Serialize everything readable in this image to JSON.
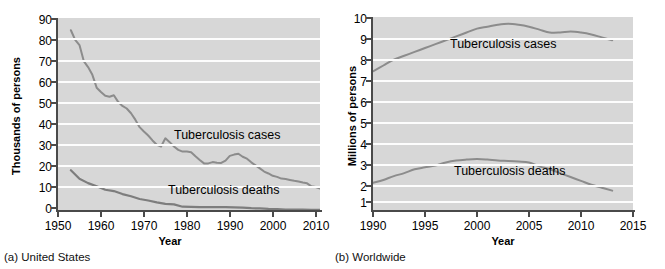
{
  "chart_data": [
    {
      "type": "line",
      "panel": "a",
      "caption": "(a) United States",
      "title": "",
      "xlabel": "Year",
      "ylabel": "Thousands of persons",
      "xlim": [
        1950,
        2011
      ],
      "ylim": [
        0,
        90
      ],
      "xticks": [
        1950,
        1960,
        1970,
        1980,
        1990,
        2000,
        2010
      ],
      "yticks": [
        0,
        10,
        20,
        30,
        40,
        50,
        60,
        70,
        80,
        90
      ],
      "grid": "horizontal",
      "legend_position": "inline-annotation",
      "series": [
        {
          "name": "Tuberculosis cases",
          "x": [
            1953,
            1954,
            1955,
            1956,
            1957,
            1958,
            1959,
            1960,
            1961,
            1962,
            1963,
            1964,
            1965,
            1966,
            1967,
            1968,
            1969,
            1970,
            1971,
            1972,
            1973,
            1974,
            1975,
            1976,
            1977,
            1978,
            1979,
            1980,
            1981,
            1982,
            1983,
            1984,
            1985,
            1986,
            1987,
            1988,
            1989,
            1990,
            1991,
            1992,
            1993,
            1994,
            1995,
            1996,
            1997,
            1998,
            1999,
            2000,
            2001,
            2002,
            2003,
            2004,
            2005,
            2006,
            2007,
            2008,
            2009,
            2010,
            2011
          ],
          "values": [
            84.3,
            79.8,
            77.4,
            69.9,
            67.1,
            63.5,
            57.5,
            55.5,
            53.7,
            53.3,
            54.0,
            50.9,
            49.0,
            47.8,
            45.6,
            42.6,
            39.1,
            37.1,
            35.2,
            32.9,
            30.9,
            30.1,
            33.9,
            32.1,
            30.1,
            28.5,
            27.7,
            27.7,
            27.4,
            25.5,
            23.8,
            22.2,
            22.2,
            22.8,
            22.5,
            22.4,
            23.5,
            25.7,
            26.3,
            26.7,
            25.3,
            24.4,
            22.7,
            21.3,
            19.9,
            18.4,
            17.5,
            16.4,
            15.9,
            15.1,
            14.9,
            14.5,
            14.1,
            13.8,
            13.3,
            12.9,
            11.5,
            11.2,
            10.5
          ]
        },
        {
          "name": "Tuberculosis deaths",
          "x": [
            1953,
            1955,
            1957,
            1959,
            1961,
            1963,
            1965,
            1967,
            1969,
            1971,
            1973,
            1975,
            1977,
            1979,
            1981,
            1983,
            1985,
            1987,
            1989,
            1991,
            1993,
            1995,
            1997,
            1999,
            2001,
            2003,
            2005,
            2007,
            2009,
            2011
          ],
          "values": [
            19.0,
            15.0,
            13.0,
            11.5,
            9.9,
            9.3,
            7.9,
            6.9,
            5.6,
            4.9,
            4.0,
            3.3,
            3.1,
            2.0,
            1.9,
            1.8,
            1.8,
            1.8,
            1.8,
            1.7,
            1.6,
            1.3,
            1.2,
            1.0,
            0.9,
            0.7,
            0.6,
            0.6,
            0.5,
            0.5
          ]
        }
      ]
    },
    {
      "type": "line",
      "panel": "b",
      "caption": "(b) Worldwide",
      "title": "",
      "xlabel": "Year",
      "ylabel": "Millions of persons",
      "xlim": [
        1990,
        2015
      ],
      "ylim": [
        0,
        10
      ],
      "xticks": [
        1990,
        1995,
        2000,
        2005,
        2010,
        2015
      ],
      "yticks": [
        1,
        2,
        3,
        4,
        5,
        6,
        7,
        8,
        9,
        10
      ],
      "grid": "horizontal",
      "legend_position": "inline-annotation",
      "series": [
        {
          "name": "Tuberculosis cases",
          "x": [
            1990,
            1991,
            1992,
            1993,
            1994,
            1995,
            1996,
            1997,
            1998,
            1999,
            2000,
            2001,
            2002,
            2003,
            2004,
            2005,
            2006,
            2007,
            2008,
            2009,
            2010,
            2011,
            2012,
            2013
          ],
          "values": [
            7.2,
            7.5,
            7.8,
            8.0,
            8.2,
            8.4,
            8.6,
            8.8,
            9.0,
            9.2,
            9.4,
            9.5,
            9.6,
            9.65,
            9.6,
            9.5,
            9.35,
            9.2,
            9.2,
            9.25,
            9.2,
            9.1,
            8.95,
            8.8
          ]
        },
        {
          "name": "Tuberculosis deaths",
          "x": [
            1990,
            1991,
            1992,
            1993,
            1994,
            1995,
            1996,
            1997,
            1998,
            1999,
            2000,
            2001,
            2002,
            2003,
            2004,
            2005,
            2006,
            2007,
            2008,
            2009,
            2010,
            2011,
            2012,
            2013
          ],
          "values": [
            1.45,
            1.6,
            1.8,
            1.95,
            2.15,
            2.25,
            2.35,
            2.5,
            2.6,
            2.65,
            2.68,
            2.65,
            2.6,
            2.58,
            2.55,
            2.5,
            2.3,
            2.15,
            1.95,
            1.75,
            1.55,
            1.35,
            1.2,
            1.05
          ]
        }
      ]
    }
  ],
  "panels": {
    "a": {
      "ylabel": "Thousands of persons",
      "xlabel": "Year",
      "caption": "(a) United States",
      "yticks": [
        "90",
        "80",
        "70",
        "60",
        "50",
        "40",
        "30",
        "20",
        "10",
        "0"
      ],
      "xticks": [
        "1950",
        "1960",
        "1970",
        "1980",
        "1990",
        "2000",
        "2010"
      ],
      "label_cases": "Tuberculosis cases",
      "label_deaths": "Tuberculosis deaths"
    },
    "b": {
      "ylabel": "Millions of persons",
      "xlabel": "Year",
      "caption": "(b) Worldwide",
      "yticks": [
        "10",
        "9",
        "8",
        "7",
        "6",
        "5",
        "4",
        "3",
        "2",
        "1"
      ],
      "xticks": [
        "1990",
        "1995",
        "2000",
        "2005",
        "2010",
        "2015"
      ],
      "label_cases": "Tuberculosis cases",
      "label_deaths": "Tuberculosis deaths"
    }
  },
  "colors": {
    "plot_background": "#d7d7d7",
    "gridline": "#fdfdfd",
    "axis": "#4a4a4a",
    "series_line": "#8c8c8c",
    "page_background": "#ffffff",
    "text": "#000000"
  }
}
